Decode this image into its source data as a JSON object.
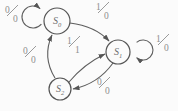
{
  "diagram": {
    "type": "mealy-state-machine",
    "colors": {
      "background": "#fbfbfb",
      "stroke": "#5e5e5e",
      "state_text": "#6e6e6e",
      "label_text": "#8f8f8f"
    },
    "states": [
      {
        "id": "S0",
        "base": "S",
        "sub": "0"
      },
      {
        "id": "S1",
        "base": "S",
        "sub": "1"
      },
      {
        "id": "S2",
        "base": "S",
        "sub": "2"
      }
    ],
    "transitions": [
      {
        "from": "S0",
        "to": "S0",
        "input": "0",
        "output": "0",
        "label": "0/0"
      },
      {
        "from": "S0",
        "to": "S1",
        "input": "1",
        "output": "0",
        "label": "1/0"
      },
      {
        "from": "S1",
        "to": "S1",
        "input": "1",
        "output": "0",
        "label": "1/0"
      },
      {
        "from": "S2",
        "to": "S1",
        "input": "1",
        "output": "1",
        "label": "1/1"
      },
      {
        "from": "S1",
        "to": "S2",
        "input": "0",
        "output": "0",
        "label": "0/0"
      },
      {
        "from": "S2",
        "to": "S0",
        "input": "0",
        "output": "0",
        "label": "0/0"
      }
    ]
  }
}
